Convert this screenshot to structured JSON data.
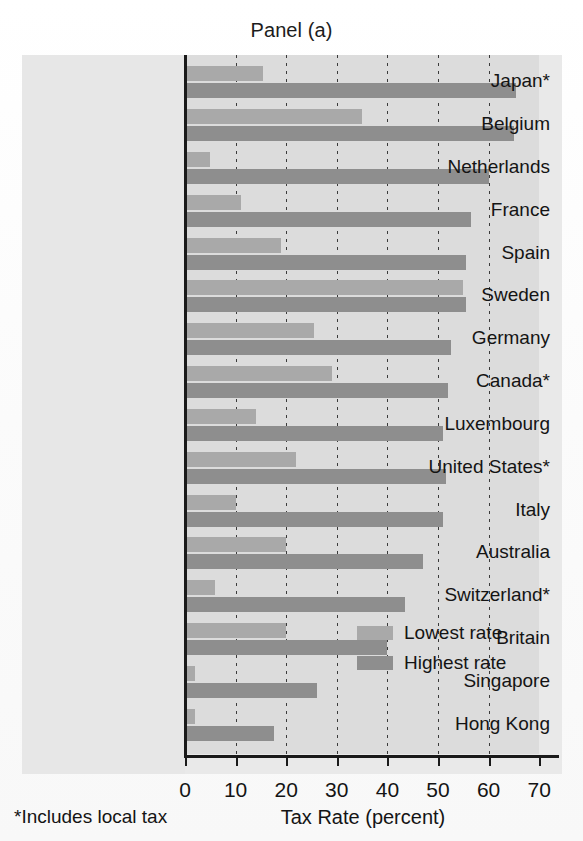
{
  "title": "Panel (a)",
  "footnote": "*Includes local tax",
  "legend": {
    "entries": [
      {
        "label": "Lowest rate",
        "color": "#a9a9a9",
        "key": "lowest"
      },
      {
        "label": "Highest rate",
        "color": "#8e8e8e",
        "key": "highest"
      }
    ]
  },
  "chart_data": {
    "type": "bar",
    "orientation": "horizontal",
    "title": "Panel (a)",
    "xlabel": "Tax Rate (percent)",
    "ylabel": "",
    "xlim": [
      0,
      70
    ],
    "xticks": [
      0,
      10,
      20,
      30,
      40,
      50,
      60,
      70
    ],
    "xticklabels": [
      "0",
      "10",
      "20",
      "30",
      "40",
      "50",
      "60",
      "70"
    ],
    "grid": "vertical-dotted",
    "legend_position": "inside-lower-right",
    "categories": [
      "Japan*",
      "Belgium",
      "Netherlands",
      "France",
      "Spain",
      "Sweden",
      "Germany",
      "Canada*",
      "Luxembourg",
      "United States*",
      "Italy",
      "Australia",
      "Switzerland*",
      "Britain",
      "Singapore",
      "Hong Kong"
    ],
    "series": [
      {
        "name": "Lowest rate",
        "color": "#a9a9a9",
        "values": [
          15.5,
          35,
          5,
          11,
          19,
          55,
          25.5,
          29,
          14,
          22,
          10,
          20,
          6,
          20,
          2,
          2
        ]
      },
      {
        "name": "Highest rate",
        "color": "#8e8e8e",
        "values": [
          65.5,
          65,
          60,
          56.5,
          55.5,
          55.5,
          52.5,
          52,
          51,
          51.5,
          51,
          47,
          43.5,
          40,
          26,
          17.5
        ]
      }
    ],
    "annotations": [
      "*Includes local tax"
    ]
  },
  "colors": {
    "lowest": "#a9a9a9",
    "highest": "#8e8e8e",
    "plot_background": "#dcdcdc",
    "figure_background": "#e9e9e9",
    "axis": "#1a1a1a"
  }
}
